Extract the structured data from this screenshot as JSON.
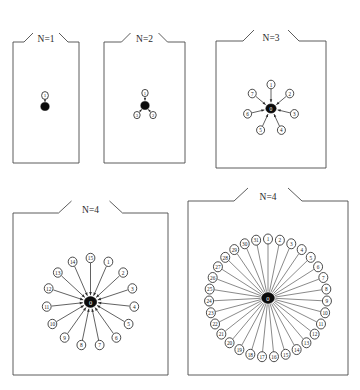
{
  "figure": {
    "title": "",
    "background_color": "#ffffff",
    "line_color": "#3a3a3a",
    "node_fill": "#ffffff",
    "node_stroke": "#2b2b2b",
    "center_fill": "#0b0b0b",
    "center_label_color": "#ffffff"
  },
  "panels": [
    {
      "id": "panel-n1",
      "title": "N=1",
      "center_label": "",
      "node_labels": [
        "1"
      ],
      "node_count": 1,
      "layout": "vertical-single",
      "box": {
        "x": 13,
        "y": 42,
        "w": 66,
        "h": 121
      }
    },
    {
      "id": "panel-n2",
      "title": "N=2",
      "center_label": "",
      "node_labels": [
        "1",
        "2",
        "3"
      ],
      "node_count": 3,
      "layout": "tripod",
      "box": {
        "x": 104,
        "y": 42,
        "w": 81,
        "h": 121
      }
    },
    {
      "id": "panel-n3",
      "title": "N=3",
      "center_label": "0",
      "node_labels": [
        "1",
        "2",
        "3",
        "4",
        "5",
        "6",
        "7"
      ],
      "node_count": 7,
      "layout": "radial",
      "box": {
        "x": 216,
        "y": 41,
        "w": 110,
        "h": 127
      }
    },
    {
      "id": "panel-n4-left",
      "title": "N=4",
      "center_label": "0",
      "node_labels": [
        "1",
        "2",
        "3",
        "4",
        "5",
        "6",
        "7",
        "8",
        "9",
        "10",
        "11",
        "12",
        "13",
        "14",
        "15"
      ],
      "node_count": 15,
      "layout": "radial",
      "box": {
        "x": 13,
        "y": 213,
        "w": 155,
        "h": 162
      }
    },
    {
      "id": "panel-n4-right",
      "title": "N=4",
      "center_label": "0",
      "node_labels": [
        "1",
        "2",
        "3",
        "4",
        "5",
        "6",
        "7",
        "8",
        "9",
        "10",
        "11",
        "12",
        "13",
        "14",
        "15",
        "16",
        "17",
        "18",
        "19",
        "20",
        "21",
        "22",
        "23",
        "24",
        "25",
        "26",
        "27",
        "28",
        "29",
        "30",
        "31"
      ],
      "node_count": 31,
      "layout": "radial",
      "box": {
        "x": 188,
        "y": 201,
        "w": 160,
        "h": 174
      }
    }
  ]
}
